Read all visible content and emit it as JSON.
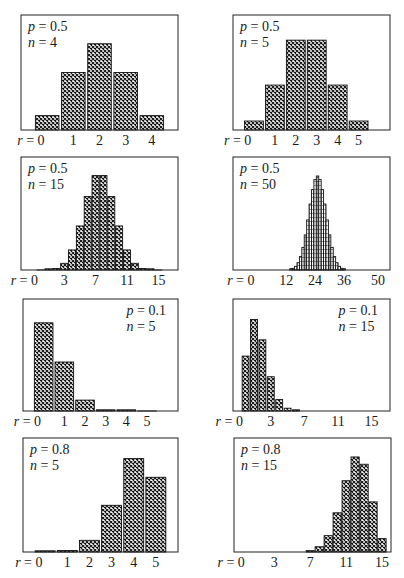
{
  "chart_data": [
    {
      "type": "bar",
      "title": "Binomial distribution p = 0.5, n = 4",
      "annotation": {
        "p_label": "p",
        "p": "0.5",
        "n_label": "n",
        "n": "4",
        "position": "top-left"
      },
      "xlabel": "r",
      "x_ticks": [
        "r = 0",
        "1",
        "2",
        "3",
        "4"
      ],
      "x_tick_positions": [
        0,
        1,
        2,
        3,
        4
      ],
      "categories": [
        0,
        1,
        2,
        3,
        4
      ],
      "values": [
        0.0625,
        0.25,
        0.375,
        0.25,
        0.0625
      ],
      "xlim": [
        -1,
        5
      ],
      "ylim": [
        0,
        0.5
      ]
    },
    {
      "type": "bar",
      "title": "Binomial distribution p = 0.5, n = 5",
      "annotation": {
        "p_label": "p",
        "p": "0.5",
        "n_label": "n",
        "n": "5",
        "position": "top-left"
      },
      "xlabel": "r",
      "x_ticks": [
        "r = 0",
        "1",
        "2",
        "3",
        "4",
        "5"
      ],
      "x_tick_positions": [
        0,
        1,
        2,
        3,
        4,
        5
      ],
      "categories": [
        0,
        1,
        2,
        3,
        4,
        5
      ],
      "values": [
        0.03125,
        0.15625,
        0.3125,
        0.3125,
        0.15625,
        0.03125
      ],
      "xlim": [
        -1,
        6.5
      ],
      "ylim": [
        0,
        0.4
      ]
    },
    {
      "type": "bar",
      "title": "Binomial distribution p = 0.5, n = 15",
      "annotation": {
        "p_label": "p",
        "p": "0.5",
        "n_label": "n",
        "n": "15",
        "position": "top-left"
      },
      "xlabel": "r",
      "x_ticks": [
        "r = 0",
        "3",
        "7",
        "11",
        "15"
      ],
      "x_tick_positions": [
        0,
        3,
        7,
        11,
        15
      ],
      "categories": [
        0,
        1,
        2,
        3,
        4,
        5,
        6,
        7,
        8,
        9,
        10,
        11,
        12,
        13,
        14,
        15
      ],
      "values": [
        3e-05,
        0.0005,
        0.0032,
        0.0139,
        0.0417,
        0.0916,
        0.1527,
        0.1964,
        0.1964,
        0.1527,
        0.0916,
        0.0417,
        0.0139,
        0.0032,
        0.0005,
        3e-05
      ],
      "xlim": [
        -2.5,
        17.5
      ],
      "ylim": [
        0,
        0.235
      ]
    },
    {
      "type": "bar",
      "title": "Binomial distribution p = 0.5, n = 50",
      "annotation": {
        "p_label": "p",
        "p": "0.5",
        "n_label": "n",
        "n": "50",
        "position": "top-left"
      },
      "xlabel": "r",
      "x_ticks": [
        "r = 0",
        "12",
        "24",
        "36",
        "50"
      ],
      "x_tick_positions": [
        0,
        12,
        24,
        36,
        50
      ],
      "categories": [
        14,
        15,
        16,
        17,
        18,
        19,
        20,
        21,
        22,
        23,
        24,
        25,
        26,
        27,
        28,
        29,
        30,
        31,
        32,
        33,
        34,
        35,
        36
      ],
      "values": [
        0.0016,
        0.002,
        0.0044,
        0.0087,
        0.016,
        0.027,
        0.0419,
        0.0598,
        0.0788,
        0.096,
        0.108,
        0.1123,
        0.108,
        0.096,
        0.0788,
        0.0598,
        0.0419,
        0.027,
        0.016,
        0.0087,
        0.0044,
        0.002,
        0.0016
      ],
      "xlim": [
        -10,
        55
      ],
      "ylim": [
        0,
        0.135
      ]
    },
    {
      "type": "bar",
      "title": "Binomial distribution p = 0.1, n = 5",
      "annotation": {
        "p_label": "p",
        "p": "0.1",
        "n_label": "n",
        "n": "5",
        "position": "top-right"
      },
      "xlabel": "r",
      "x_ticks": [
        "r = 0",
        "1",
        "2",
        "3",
        "4",
        "5"
      ],
      "x_tick_positions": [
        0,
        1,
        2,
        3,
        4,
        5
      ],
      "categories": [
        0,
        1,
        2,
        3,
        4,
        5
      ],
      "values": [
        0.59049,
        0.32805,
        0.0729,
        0.0081,
        0.00045,
        1e-05
      ],
      "xlim": [
        -1,
        6.5
      ],
      "ylim": [
        0,
        0.75
      ]
    },
    {
      "type": "bar",
      "title": "Binomial distribution p = 0.1, n = 15",
      "annotation": {
        "p_label": "p",
        "p": "0.1",
        "n_label": "n",
        "n": "15",
        "position": "top-right"
      },
      "xlabel": "r",
      "x_ticks": [
        "r = 0",
        "3",
        "7",
        "11",
        "15"
      ],
      "x_tick_positions": [
        0,
        3,
        7,
        11,
        15
      ],
      "categories": [
        0,
        1,
        2,
        3,
        4,
        5,
        6
      ],
      "values": [
        0.2059,
        0.3432,
        0.2669,
        0.1285,
        0.0428,
        0.0105,
        0.0019
      ],
      "xlim": [
        -1.5,
        17.2
      ],
      "ylim": [
        0,
        0.42
      ]
    },
    {
      "type": "bar",
      "title": "Binomial distribution p = 0.8, n = 5",
      "annotation": {
        "p_label": "p",
        "p": "0.8",
        "n_label": "n",
        "n": "5",
        "position": "top-left"
      },
      "xlabel": "r",
      "x_ticks": [
        "r = 0",
        "1",
        "2",
        "3",
        "4",
        "5"
      ],
      "x_tick_positions": [
        0,
        1,
        2,
        3,
        4,
        5
      ],
      "categories": [
        0,
        1,
        2,
        3,
        4,
        5
      ],
      "values": [
        0.00032,
        0.0064,
        0.0512,
        0.2048,
        0.4096,
        0.32768
      ],
      "xlim": [
        -1,
        6
      ],
      "ylim": [
        0,
        0.5
      ]
    },
    {
      "type": "bar",
      "title": "Binomial distribution p = 0.8, n = 15",
      "annotation": {
        "p_label": "p",
        "p": "0.8",
        "n_label": "n",
        "n": "15",
        "position": "top-left"
      },
      "xlabel": "r",
      "x_ticks": [
        "r = 0",
        "3",
        "7",
        "11",
        "15"
      ],
      "x_tick_positions": [
        0,
        3,
        7,
        11,
        15
      ],
      "categories": [
        7,
        8,
        9,
        10,
        11,
        12,
        13,
        14,
        15
      ],
      "values": [
        0.0035,
        0.0138,
        0.043,
        0.1032,
        0.1876,
        0.2501,
        0.2309,
        0.1319,
        0.0352
      ],
      "xlim": [
        -1.5,
        16
      ],
      "ylim": [
        0,
        0.3
      ]
    }
  ],
  "panels": [
    {
      "id": "p05n4",
      "box": [
        21,
        15,
        157,
        115
      ]
    },
    {
      "id": "p05n5",
      "box": [
        233,
        15,
        157,
        115
      ]
    },
    {
      "id": "p05n15",
      "box": [
        21,
        157,
        157,
        113
      ]
    },
    {
      "id": "p05n50",
      "box": [
        233,
        157,
        157,
        113
      ]
    },
    {
      "id": "p01n5",
      "box": [
        23,
        299,
        155,
        112
      ]
    },
    {
      "id": "p01n15",
      "box": [
        233,
        299,
        157,
        112
      ]
    },
    {
      "id": "p08n5",
      "box": [
        23,
        438,
        155,
        114
      ]
    },
    {
      "id": "p08n15",
      "box": [
        234,
        438,
        157,
        114
      ]
    }
  ],
  "style": {
    "bar_fill_pattern": "crosshatch",
    "bar_ink": "#111111",
    "frame": "#222222"
  }
}
